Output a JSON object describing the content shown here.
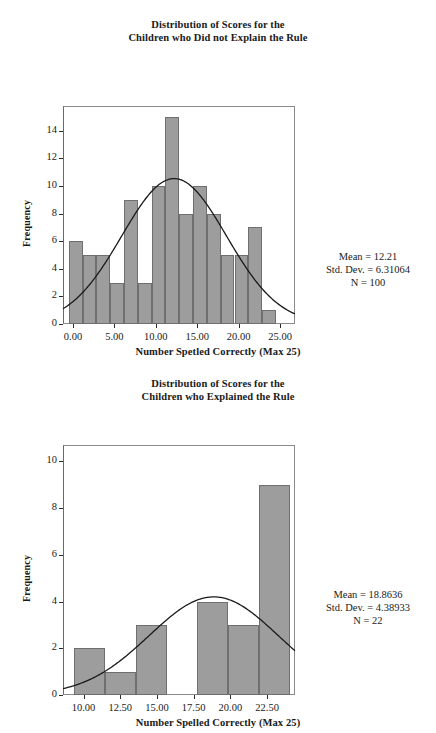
{
  "figure": {
    "background": "#ffffff",
    "bar_fill": "#9d9d9d",
    "bar_stroke": "#6f6f6f",
    "curve_color": "#1a1a1a",
    "axis_color": "#2b2b2b"
  },
  "chart_data": [
    {
      "id": "top",
      "type": "bar",
      "title": "Distribution of Scores for the Children who Did not Explain the Rule",
      "title_line1": "Distribution of Scores for the",
      "title_line2": "Children who Did not Explain the Rule",
      "xlabel": "Number Spetled Correctly (Max 25)",
      "ylabel": "Frequency",
      "xlim": [
        -1.2,
        26.8
      ],
      "ylim": [
        0,
        15.8
      ],
      "xticks": [
        0,
        5,
        10,
        15,
        20,
        25
      ],
      "xtick_labels": [
        "0.00",
        "5.00",
        "10.00",
        "15.00",
        "20.00",
        "25.00"
      ],
      "yticks": [
        0,
        2,
        4,
        6,
        8,
        10,
        12,
        14
      ],
      "ytick_labels": [
        "0",
        "2",
        "4",
        "6",
        "8",
        "10",
        "12",
        "14"
      ],
      "grid": false,
      "bin_width": 1.667,
      "bin_starts": [
        -0.5,
        1.167,
        2.833,
        4.5,
        6.167,
        7.833,
        9.5,
        11.167,
        12.833,
        14.5,
        16.167,
        17.833,
        19.5,
        21.167,
        22.833
      ],
      "categories": [
        "0.0",
        "1.7",
        "3.3",
        "5.0",
        "6.7",
        "8.3",
        "10.0",
        "11.7",
        "13.3",
        "15.0",
        "16.7",
        "18.3",
        "20.0",
        "21.7",
        "23.3"
      ],
      "values": [
        6,
        5,
        5,
        3,
        9,
        3,
        10,
        15,
        8,
        10,
        8,
        5,
        5,
        7,
        1
      ],
      "normal_curve": {
        "mean": 12.21,
        "sd": 6.31064,
        "n": 100,
        "peak": 10.55
      },
      "stats": {
        "mean_label": "Mean = 12.21",
        "sd_label": "Std. Dev. = 6.31064",
        "n_label": "N = 100",
        "mean": 12.21,
        "std_dev": 6.31064,
        "n": 100
      }
    },
    {
      "id": "bottom",
      "type": "bar",
      "title": "Distribution of Scores for the Children who Explained the Rule",
      "title_line1": "Distribution of Scores for the",
      "title_line2": "Children who Explained the Rule",
      "xlabel": "Number Spelled Correctly (Max 25)",
      "ylabel": "Frequency",
      "xlim": [
        8.6,
        24.4
      ],
      "ylim": [
        0,
        10.7
      ],
      "xticks": [
        10,
        12.5,
        15,
        17.5,
        20,
        22.5
      ],
      "xtick_labels": [
        "10.00",
        "12.50",
        "15.00",
        "17.50",
        "20.00",
        "22.50"
      ],
      "yticks": [
        0,
        2,
        4,
        6,
        8,
        10
      ],
      "ytick_labels": [
        "0",
        "2",
        "4",
        "6",
        "8",
        "10"
      ],
      "grid": false,
      "bin_width": 2.1,
      "bin_starts": [
        9.35,
        11.45,
        13.55,
        17.75,
        19.85,
        21.95
      ],
      "categories": [
        "10.0",
        "12.5",
        "14.6",
        "18.8",
        "20.9",
        "23.0"
      ],
      "values": [
        2,
        1,
        3,
        4,
        3,
        9
      ],
      "normal_curve": {
        "mean": 18.8636,
        "sd": 4.38933,
        "n": 22,
        "peak": 4.15
      },
      "stats": {
        "mean_label": "Mean = 18.8636",
        "sd_label": "Std. Dev. = 4.38933",
        "n_label": "N = 22",
        "mean": 18.8636,
        "std_dev": 4.38933,
        "n": 22
      }
    }
  ]
}
